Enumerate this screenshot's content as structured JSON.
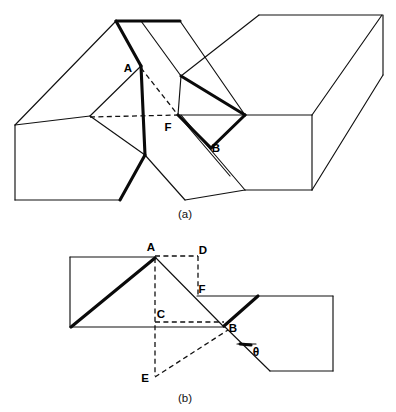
{
  "figure": {
    "background_color": "#ffffff",
    "line_color": "#111111",
    "bold_line_color": "#0a0a0a",
    "panels": [
      {
        "id": "panel-a",
        "caption": "(a)",
        "view": "three-dimensional perspective of two offset blocks",
        "labels": [
          {
            "name": "A",
            "text": "A",
            "x": 128,
            "y": 69
          },
          {
            "name": "F",
            "text": "F",
            "x": 168,
            "y": 128
          },
          {
            "name": "B",
            "text": "B",
            "x": 216,
            "y": 148
          }
        ]
      },
      {
        "id": "panel-b",
        "caption": "(b)",
        "view": "two-dimensional projection with construction lines",
        "labels": [
          {
            "name": "A",
            "text": "A",
            "x": 151,
            "y": 248
          },
          {
            "name": "D",
            "text": "D",
            "x": 200,
            "y": 252
          },
          {
            "name": "F",
            "text": "F",
            "x": 199,
            "y": 290
          },
          {
            "name": "C",
            "text": "C",
            "x": 159,
            "y": 316
          },
          {
            "name": "B",
            "text": "B",
            "x": 230,
            "y": 329
          },
          {
            "name": "E",
            "text": "E",
            "x": 143,
            "y": 379
          },
          {
            "name": "theta",
            "text": "θ",
            "x": 258,
            "y": 352
          }
        ]
      }
    ]
  },
  "captions": {
    "panel_a": "(a)",
    "panel_b": "(b)"
  },
  "vertices": {
    "panel_a": {
      "A": "A",
      "F": "F",
      "B": "B"
    },
    "panel_b": {
      "A": "A",
      "B": "B",
      "C": "C",
      "D": "D",
      "E": "E",
      "F": "F",
      "theta": "θ"
    }
  }
}
